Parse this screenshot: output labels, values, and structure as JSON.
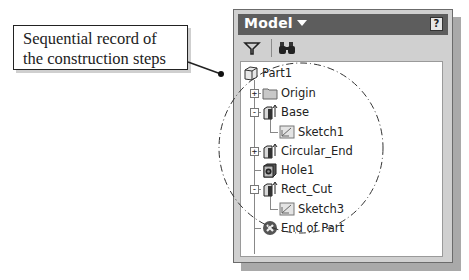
{
  "callout": {
    "line1": "Sequential record of",
    "line2": "the construction steps"
  },
  "panel": {
    "title": "Model",
    "title_dropdown_icon": "triangle-down-icon",
    "help_label": "?",
    "toolbar": {
      "filter_icon": "filter-icon",
      "find_icon": "binoculars-icon"
    },
    "tree": [
      {
        "label": "Part1",
        "icon": "part-cube-icon",
        "level": 0
      },
      {
        "label": "Origin",
        "icon": "folder-icon",
        "level": 1,
        "expander": "+"
      },
      {
        "label": "Base",
        "icon": "extrude-feature-icon",
        "level": 1,
        "expander": "-"
      },
      {
        "label": "Sketch1",
        "icon": "sketch-icon",
        "level": 2
      },
      {
        "label": "Circular_End",
        "icon": "extrude-feature-icon",
        "level": 1,
        "expander": "+"
      },
      {
        "label": "Hole1",
        "icon": "hole-feature-icon",
        "level": 1
      },
      {
        "label": "Rect_Cut",
        "icon": "extrude-feature-icon",
        "level": 1,
        "expander": "-"
      },
      {
        "label": "Sketch3",
        "icon": "sketch-icon",
        "level": 2
      },
      {
        "label": "End of Part",
        "icon": "end-of-part-icon",
        "level": 1
      }
    ]
  }
}
